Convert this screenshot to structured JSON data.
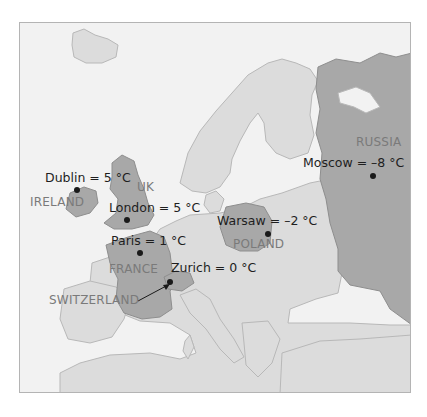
{
  "map": {
    "title": "",
    "colors": {
      "sea": "#f2f2f2",
      "land": "#dcdcdc",
      "highlight_land": "#a8a8a8",
      "border": "#b8b8b8",
      "frame": "#b4b4b4",
      "city_text": "#1e1e1e",
      "country_text": "#7a7a7a"
    },
    "cities": [
      {
        "name": "Dublin",
        "label": "Dublin = 5 °C",
        "temp_c": 5
      },
      {
        "name": "London",
        "label": "London = 5 °C",
        "temp_c": 5
      },
      {
        "name": "Paris",
        "label": "Paris = 1 °C",
        "temp_c": 1
      },
      {
        "name": "Zurich",
        "label": "Zurich = 0 °C",
        "temp_c": 0
      },
      {
        "name": "Warsaw",
        "label": "Warsaw = –2 °C",
        "temp_c": -2
      },
      {
        "name": "Moscow",
        "label": "Moscow = –8 °C",
        "temp_c": -8
      }
    ],
    "countries": [
      {
        "name": "IRELAND"
      },
      {
        "name": "UK"
      },
      {
        "name": "FRANCE"
      },
      {
        "name": "SWITZERLAND"
      },
      {
        "name": "POLAND"
      },
      {
        "name": "RUSSIA"
      }
    ]
  }
}
